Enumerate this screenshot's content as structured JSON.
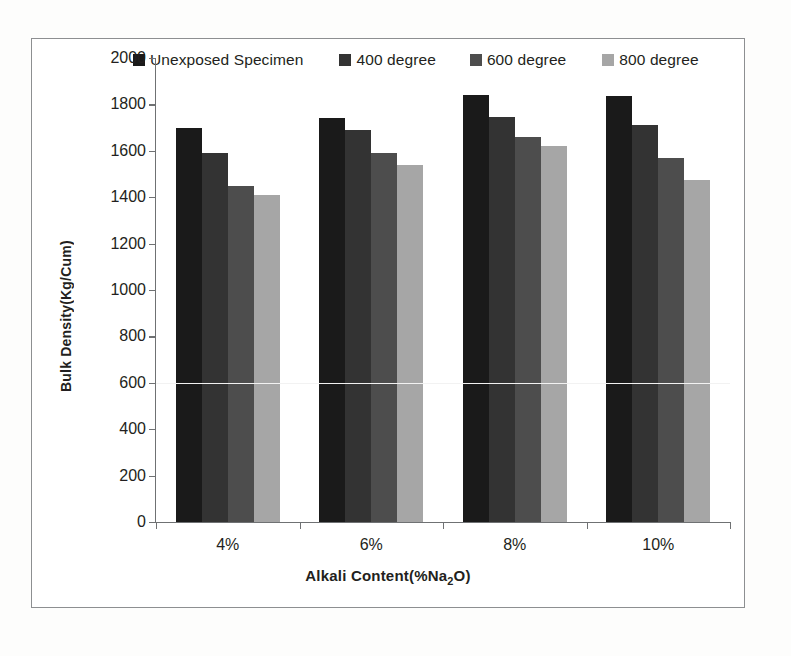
{
  "chart_data": {
    "type": "bar",
    "title": "",
    "xlabel": "Alkali Content(%Na2O)",
    "ylabel": "Bulk Density(Kg/Cum)",
    "categories": [
      "4%",
      "6%",
      "8%",
      "10%"
    ],
    "series": [
      {
        "name": "Unexposed Specimen",
        "color": "#1a1a1a",
        "values": [
          1700,
          1740,
          1840,
          1835
        ]
      },
      {
        "name": "400 degree",
        "color": "#333333",
        "values": [
          1590,
          1690,
          1745,
          1710
        ]
      },
      {
        "name": "600 degree",
        "color": "#4d4d4d",
        "values": [
          1450,
          1590,
          1660,
          1570
        ]
      },
      {
        "name": "800 degree",
        "color": "#a6a6a6",
        "values": [
          1410,
          1540,
          1620,
          1475
        ]
      }
    ],
    "ylim": [
      0,
      2000
    ],
    "ytick_step": 200,
    "yticks": [
      "0",
      "200",
      "400",
      "600",
      "800",
      "1000",
      "1200",
      "1400",
      "1600",
      "1800",
      "2000"
    ],
    "grid": false,
    "legend_position": "top"
  },
  "axis": {
    "y_title": "Bulk Density(Kg/Cum)",
    "x_title_main": "Alkali Content(%Na",
    "x_title_sub": "2",
    "x_title_tail": "O)"
  },
  "legend": {
    "items": [
      {
        "label": "Unexposed Specimen",
        "color": "#1a1a1a"
      },
      {
        "label": "400 degree",
        "color": "#333333"
      },
      {
        "label": "600 degree",
        "color": "#4d4d4d"
      },
      {
        "label": "800 degree",
        "color": "#a6a6a6"
      }
    ]
  }
}
